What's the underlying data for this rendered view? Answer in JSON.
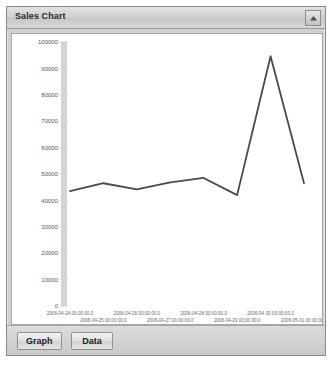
{
  "panel": {
    "title": "Sales Chart",
    "collapse_icon": "collapse-up-icon"
  },
  "toolbar": {
    "graph_label": "Graph",
    "data_label": "Data"
  },
  "chart_data": {
    "type": "line",
    "title": "Sales Chart",
    "xlabel": "",
    "ylabel": "",
    "grid": false,
    "legend": "none",
    "line_color": "#4a4a4a",
    "ylim": [
      0,
      100000
    ],
    "yticks": [
      0,
      10000,
      20000,
      30000,
      40000,
      50000,
      60000,
      70000,
      80000,
      90000,
      100000
    ],
    "ytick_labels": [
      "0",
      "10000",
      "20000",
      "30000",
      "40000",
      "50000",
      "60000",
      "70000",
      "80000",
      "90000",
      "100000"
    ],
    "categories": [
      "2006-04-24 00:00:00.0",
      "2006-04-25 00:00:00.0",
      "2006-04-26 00:00:00.0",
      "2006-04-27 00:00:00.0",
      "2006-04-28 00:00:00.0",
      "2006-04-29 00:00:00.0",
      "2006-04-30 00:00:00.0",
      "2006-05-01 00:00:00.0"
    ],
    "values": [
      43500,
      46500,
      44200,
      46800,
      48500,
      42000,
      94600,
      46500
    ]
  }
}
